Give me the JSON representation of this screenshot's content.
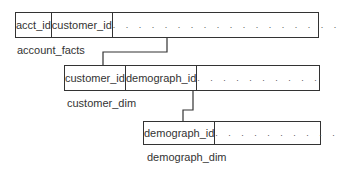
{
  "tables": [
    {
      "name": "account_facts",
      "columns": [
        "acct_id",
        "customer_id",
        ". . . . . . . . . . . . . . . . . ."
      ]
    },
    {
      "name": "customer_dim",
      "columns": [
        "customer_id",
        "demograph_id",
        ". . . . . . . . . ."
      ]
    },
    {
      "name": "demograph_dim",
      "columns": [
        "demograph_id",
        ". . . . . . . . . ."
      ]
    }
  ],
  "links": [
    {
      "from": "account_facts.customer_id",
      "to": "customer_dim.customer_id"
    },
    {
      "from": "customer_dim.demograph_id",
      "to": "demograph_dim.demograph_id"
    }
  ]
}
